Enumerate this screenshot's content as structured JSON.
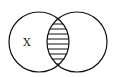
{
  "diagram": {
    "type": "venn",
    "sets": [
      {
        "id": "left",
        "label": "X",
        "cx": 39,
        "cy": 42,
        "r": 30
      },
      {
        "id": "right",
        "label": "",
        "cx": 77,
        "cy": 42,
        "r": 30
      }
    ],
    "shaded_region": "intersection",
    "shading_pattern": "horizontal-lines",
    "stroke_color": "#111111",
    "background": "#ffffff"
  }
}
